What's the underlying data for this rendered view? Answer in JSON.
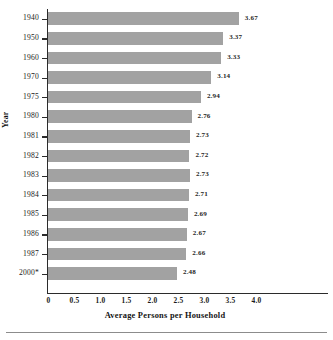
{
  "chart_data": {
    "type": "bar",
    "orientation": "horizontal",
    "title": "",
    "xlabel": "Average Persons per Household",
    "ylabel": "Year",
    "categories": [
      "1940",
      "1950",
      "1960",
      "1970",
      "1975",
      "1980",
      "1981",
      "1982",
      "1983",
      "1984",
      "1985",
      "1986",
      "1987",
      "2000*"
    ],
    "values": [
      3.67,
      3.37,
      3.33,
      3.14,
      2.94,
      2.76,
      2.73,
      2.72,
      2.73,
      2.71,
      2.69,
      2.67,
      2.66,
      2.48
    ],
    "data_labels": [
      "3.67",
      "3.37",
      "3.33",
      "3.14",
      "2.94",
      "2.76",
      "2.73",
      "2.72",
      "2.73",
      "2.71",
      "2.69",
      "2.67",
      "2.66",
      "2.48"
    ],
    "xlim": [
      0,
      5.4
    ],
    "xticks": [
      0,
      0.5,
      1.0,
      1.5,
      2.0,
      2.5,
      3.0,
      3.5,
      4.0
    ],
    "xtick_labels": [
      "0",
      "0.5",
      "1.0",
      "1.5",
      "2.0",
      "2.5",
      "3.0",
      "3.5",
      "4.0"
    ],
    "grid": false,
    "legend": "none",
    "bar_color": "#a2a2a2",
    "axis_color": "#2b2b2b",
    "text_color": "#1b1b1b",
    "footnote_marker": "*"
  }
}
